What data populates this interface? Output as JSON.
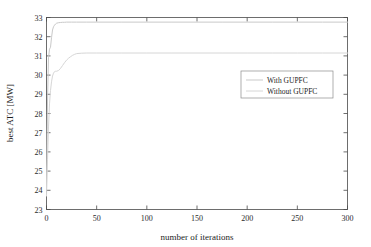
{
  "chart_data": {
    "type": "line",
    "title": "",
    "xlabel": "number of iterations",
    "ylabel": "best ATC [MW]",
    "xlim": [
      0,
      300
    ],
    "ylim": [
      23,
      33
    ],
    "xticks": [
      0,
      50,
      100,
      150,
      200,
      250,
      300
    ],
    "yticks": [
      23,
      24,
      25,
      26,
      27,
      28,
      29,
      30,
      31,
      32,
      33
    ],
    "xtick_labels": [
      "0",
      "50",
      "100",
      "150",
      "200",
      "250",
      "300"
    ],
    "ytick_labels": [
      "23",
      "24",
      "25",
      "26",
      "27",
      "28",
      "29",
      "30",
      "31",
      "32",
      "33"
    ],
    "grid": false,
    "legend_position": "center-right",
    "colors": {
      "with_gupfc": "#c9c9c9",
      "without_gupfc": "#d6d6d6",
      "axis": "#4a4a4a",
      "text": "#1d1d1d"
    },
    "series": [
      {
        "name": "With GUPFC",
        "color": "#c9c9c9",
        "x": [
          0,
          1,
          2,
          3,
          4,
          5,
          6,
          7,
          8,
          9,
          10,
          12,
          14,
          16,
          18,
          20,
          25,
          30,
          40,
          50,
          75,
          100,
          125,
          150,
          175,
          200,
          225,
          250,
          275,
          300
        ],
        "y": [
          24.05,
          28.6,
          30.9,
          31.35,
          31.45,
          31.95,
          32.35,
          32.52,
          32.6,
          32.66,
          32.7,
          32.73,
          32.74,
          32.75,
          32.75,
          32.76,
          32.76,
          32.76,
          32.76,
          32.76,
          32.76,
          32.76,
          32.76,
          32.76,
          32.76,
          32.76,
          32.76,
          32.76,
          32.76,
          32.76
        ]
      },
      {
        "name": "Without GUPFC",
        "color": "#d6d6d6",
        "x": [
          0,
          1,
          2,
          3,
          4,
          5,
          6,
          7,
          8,
          9,
          10,
          12,
          14,
          16,
          18,
          20,
          22,
          24,
          26,
          28,
          30,
          35,
          40,
          50,
          75,
          100,
          125,
          150,
          175,
          200,
          225,
          250,
          275,
          300
        ],
        "y": [
          23.7,
          25.6,
          27.3,
          28.5,
          29.2,
          29.65,
          29.95,
          30.1,
          30.18,
          30.2,
          30.2,
          30.24,
          30.35,
          30.5,
          30.65,
          30.78,
          30.88,
          30.96,
          31.03,
          31.08,
          31.12,
          31.14,
          31.15,
          31.15,
          31.15,
          31.15,
          31.15,
          31.15,
          31.15,
          31.15,
          31.15,
          31.15,
          31.15,
          31.15
        ]
      }
    ],
    "legend": [
      {
        "label": "With GUPFC",
        "color": "#c9c9c9"
      },
      {
        "label": "Without GUPFC",
        "color": "#d6d6d6"
      }
    ]
  }
}
